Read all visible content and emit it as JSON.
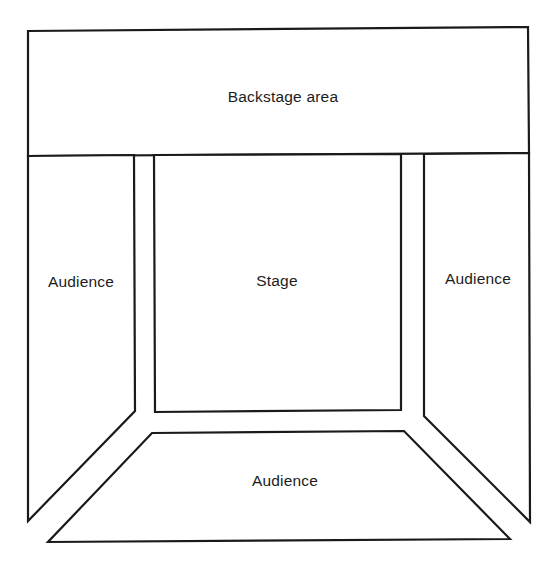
{
  "diagram": {
    "type": "theatre-floor-plan",
    "line_color": "#1a1a1a",
    "background": "#ffffff",
    "regions": {
      "backstage": {
        "label": "Backstage area"
      },
      "stage": {
        "label": "Stage"
      },
      "audience_left": {
        "label": "Audience"
      },
      "audience_right": {
        "label": "Audience"
      },
      "audience_front": {
        "label": "Audience"
      }
    },
    "aisles": [
      {
        "name": "left-aisle"
      },
      {
        "name": "right-aisle"
      },
      {
        "name": "front-left-diagonal-aisle"
      },
      {
        "name": "front-right-diagonal-aisle"
      }
    ]
  }
}
